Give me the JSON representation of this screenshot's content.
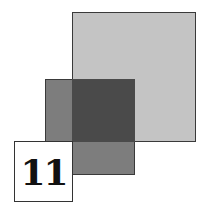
{
  "figure": {
    "number_label": "11",
    "colors": {
      "large_square": "#c4c4c4",
      "medium_square": "#6a6a6a",
      "overlap": "#4a4a4a",
      "label_box": "#ffffff",
      "border": "#3a3a3a"
    }
  }
}
